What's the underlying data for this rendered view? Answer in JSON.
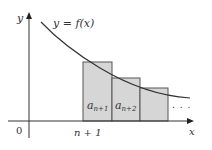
{
  "diagram": {
    "curve_label": "y = f(x)",
    "y_axis_label": "y",
    "x_axis_label": "x",
    "origin_label": "0",
    "tick_label": "n + 1",
    "rect_labels": [
      {
        "base": "a",
        "sub": "n+1"
      },
      {
        "base": "a",
        "sub": "n+2"
      }
    ],
    "ellipsis": ". . ."
  },
  "colors": {
    "rect_fill": "#d6d6d6",
    "rect_stroke": "#555555",
    "curve": "#333333",
    "axis": "#333333"
  }
}
